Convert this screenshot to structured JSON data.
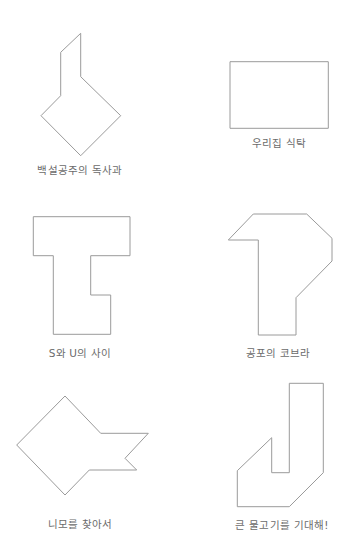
{
  "colors": {
    "stroke": "#9a9a9a",
    "text": "#6b6b6b",
    "background": "#ffffff"
  },
  "puzzles": [
    {
      "id": "snow-white-apple",
      "label": "백설공주의 독사과",
      "label_pos": {
        "x": 80,
        "y": 162
      },
      "points": "80.7,33.3 60.7,52.3 60.7,95.7 41,115.7 80.7,155.7 120.7,115.7 80.7,76.7"
    },
    {
      "id": "our-table",
      "label": "우리집 식탁",
      "label_pos": {
        "x": 279,
        "y": 135
      },
      "points": "230,61.7 328.3,61.7 328.3,128.3 230,128.3"
    },
    {
      "id": "between-s-and-u",
      "label": "S와 U의 사이",
      "label_pos": {
        "x": 80,
        "y": 345
      },
      "points": "33.3,216.7 130,216.7 130,255.7 90.7,255.7 90.7,295 110.7,295 110.7,334.3 53.3,334.3 53.3,255.7 33.3,255.7"
    },
    {
      "id": "cobra-of-fear",
      "label": "공포의 코브라",
      "label_pos": {
        "x": 278,
        "y": 345
      },
      "points": "253.3,214 306.7,214 332,238.3 332,261 296,297.7 296,335 258.3,335 258.3,240 228.3,240"
    },
    {
      "id": "finding-nemo",
      "label": "니모를 찾아서",
      "label_pos": {
        "x": 80,
        "y": 516
      },
      "points": "65,396 100.7,433.3 148.3,433.3 125,458.3 136.7,470 89.3,470 65,495 16.7,445"
    },
    {
      "id": "expect-big-fish",
      "label": "큰 물고기를 기대해!",
      "label_pos": {
        "x": 282,
        "y": 517
      },
      "points": "289.3,383.3 323.3,383.3 323.3,472.7 289.3,506.7 237.3,506.7 237.3,470.7 271.7,437.7 271.7,472.7 289.3,472.7"
    }
  ]
}
